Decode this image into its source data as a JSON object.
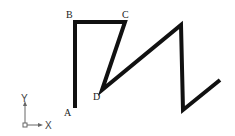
{
  "diagram": {
    "stroke_color": "#111111",
    "stroke_width": 4,
    "points": {
      "A": [
        75,
        108
      ],
      "B": [
        75,
        22
      ],
      "C": [
        125,
        22
      ],
      "D": [
        102,
        90
      ],
      "P1": [
        181,
        25
      ],
      "P2": [
        183,
        110
      ],
      "P3": [
        220,
        80
      ]
    },
    "labels": {
      "A": "A",
      "B": "B",
      "C": "C",
      "D": "D"
    }
  },
  "ucs": {
    "x_label": "X",
    "y_label": "Y",
    "color": "#666666"
  }
}
